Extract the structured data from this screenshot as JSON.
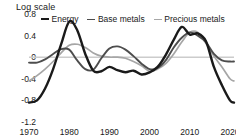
{
  "chart_data": {
    "type": "line",
    "title": "Log scale",
    "xlabel": "",
    "ylabel": "Log scale",
    "ylim": [
      -1.2,
      0.8
    ],
    "xlim": [
      1970,
      2021
    ],
    "yticks": [
      0.8,
      0.4,
      0,
      -0.4,
      -0.8,
      -1.2
    ],
    "ytick_labels": [
      "0.8",
      "0.4",
      "0",
      "-0.4",
      "-0.8",
      "-1.2"
    ],
    "xticks": [
      1970,
      1980,
      1990,
      2000,
      2010,
      2020
    ],
    "xtick_labels": [
      "1970",
      "1980",
      "1990",
      "2000",
      "2010",
      "2020"
    ],
    "grid": false,
    "zero_line": true,
    "legend_position": "top",
    "legend": [
      "Energy",
      "Base metals",
      "Precious metals"
    ],
    "colors": {
      "energy": "#1a1a1a",
      "base_metals": "#4d4d4d",
      "precious_metals": "#a6a6a6",
      "zero_line": "#cccccc",
      "background": "#ffffff",
      "text": "#1a1a1a"
    },
    "x": [
      1970,
      1972,
      1974,
      1976,
      1978,
      1980,
      1982,
      1984,
      1986,
      1988,
      1990,
      1992,
      1994,
      1996,
      1998,
      2000,
      2002,
      2004,
      2006,
      2008,
      2010,
      2012,
      2014,
      2016,
      2018,
      2020,
      2021
    ],
    "series": [
      {
        "name": "Energy",
        "color": "#1a1a1a",
        "values": [
          -0.84,
          -0.8,
          -0.58,
          -0.22,
          0.24,
          0.66,
          0.5,
          0.06,
          -0.25,
          -0.26,
          -0.18,
          -0.24,
          -0.28,
          -0.25,
          -0.32,
          -0.28,
          -0.18,
          0.04,
          0.32,
          0.56,
          0.42,
          0.44,
          0.3,
          -0.18,
          -0.52,
          -0.8,
          -0.84
        ]
      },
      {
        "name": "Base metals",
        "color": "#4d4d4d",
        "values": [
          -0.1,
          -0.1,
          -0.04,
          0.06,
          0.15,
          0.14,
          -0.06,
          -0.22,
          -0.23,
          -0.02,
          0.16,
          0.2,
          0.14,
          0.02,
          -0.12,
          -0.22,
          -0.2,
          -0.06,
          0.18,
          0.36,
          0.46,
          0.4,
          0.28,
          0.06,
          -0.06,
          -0.08,
          -0.08
        ]
      },
      {
        "name": "Precious metals",
        "color": "#a6a6a6",
        "values": [
          -0.44,
          -0.34,
          -0.22,
          -0.08,
          0.08,
          0.22,
          0.24,
          0.18,
          0.08,
          0.02,
          0.0,
          0.0,
          -0.02,
          -0.08,
          -0.16,
          -0.26,
          -0.22,
          -0.12,
          0.06,
          0.28,
          0.46,
          0.46,
          0.26,
          0.02,
          -0.18,
          -0.4,
          -0.44
        ]
      }
    ]
  }
}
